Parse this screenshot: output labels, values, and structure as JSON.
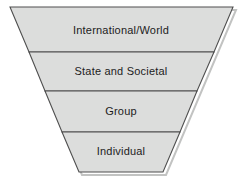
{
  "diagram": {
    "type": "inverted-pyramid-funnel",
    "tiers": [
      {
        "label": "International/World",
        "level": 1
      },
      {
        "label": "State and Societal",
        "level": 2
      },
      {
        "label": "Group",
        "level": 3
      },
      {
        "label": "Individual",
        "level": 4
      }
    ],
    "colors": {
      "band_fill": "#dcdddc",
      "outline": "#4f4f4f",
      "shadow": "#c2c3c2",
      "text": "#1c1c1c",
      "background": "#ffffff"
    }
  }
}
